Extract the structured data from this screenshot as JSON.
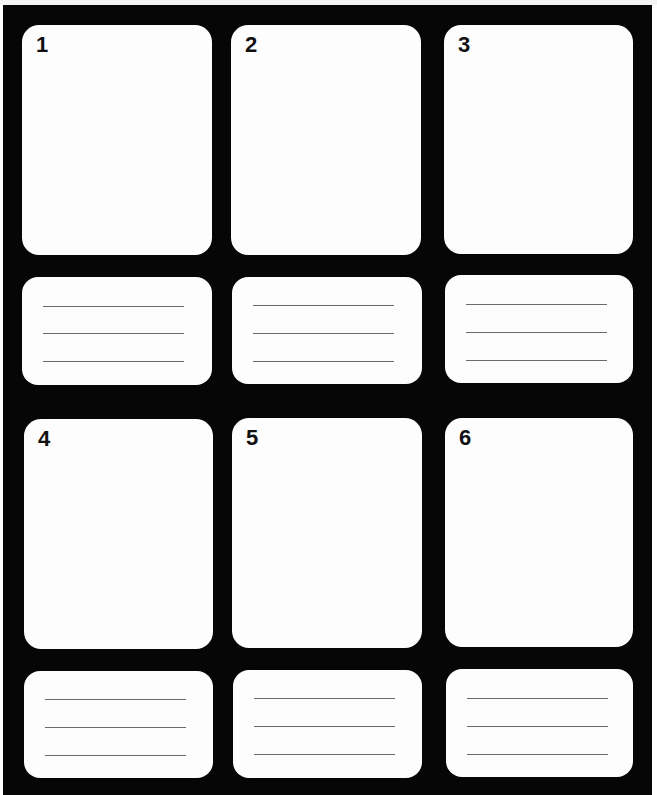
{
  "sheet": {
    "type": "storyboard-template",
    "background_color": "#060606",
    "panel_color": "#fdfdfd",
    "rule_color": "#6a6a6a"
  },
  "frames": [
    {
      "number": "1",
      "panel": {
        "x": 22,
        "y": 25,
        "w": 190,
        "h": 230
      },
      "caption": {
        "x": 22,
        "y": 277,
        "w": 190,
        "h": 108,
        "lines": 3
      }
    },
    {
      "number": "2",
      "panel": {
        "x": 231,
        "y": 25,
        "w": 190,
        "h": 230
      },
      "caption": {
        "x": 232,
        "y": 277,
        "w": 190,
        "h": 107,
        "lines": 3
      }
    },
    {
      "number": "3",
      "panel": {
        "x": 444,
        "y": 25,
        "w": 189,
        "h": 229
      },
      "caption": {
        "x": 445,
        "y": 275,
        "w": 188,
        "h": 108,
        "lines": 3
      }
    },
    {
      "number": "4",
      "panel": {
        "x": 24,
        "y": 419,
        "w": 189,
        "h": 230
      },
      "caption": {
        "x": 24,
        "y": 671,
        "w": 189,
        "h": 107,
        "lines": 3
      }
    },
    {
      "number": "5",
      "panel": {
        "x": 232,
        "y": 418,
        "w": 190,
        "h": 230
      },
      "caption": {
        "x": 233,
        "y": 670,
        "w": 189,
        "h": 108,
        "lines": 3
      }
    },
    {
      "number": "6",
      "panel": {
        "x": 445,
        "y": 418,
        "w": 188,
        "h": 229
      },
      "caption": {
        "x": 446,
        "y": 669,
        "w": 187,
        "h": 108,
        "lines": 3
      }
    }
  ]
}
